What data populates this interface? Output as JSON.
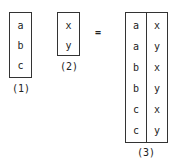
{
  "relation1": {
    "label": "(1)",
    "values": [
      "a",
      "b",
      "c"
    ]
  },
  "relation2": {
    "label": "(2)",
    "values": [
      "x",
      "y"
    ]
  },
  "operator": "=",
  "relation3": {
    "label": "(3)",
    "rows": [
      [
        "a",
        "x"
      ],
      [
        "a",
        "y"
      ],
      [
        "b",
        "x"
      ],
      [
        "b",
        "y"
      ],
      [
        "c",
        "x"
      ],
      [
        "c",
        "y"
      ]
    ]
  }
}
